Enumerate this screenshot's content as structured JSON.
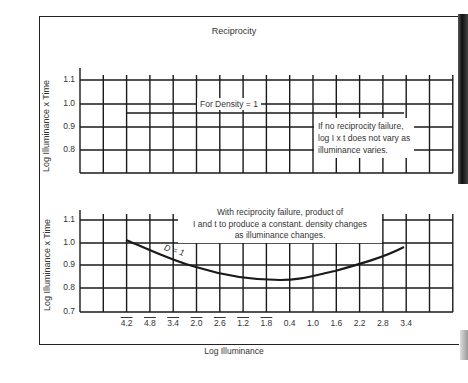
{
  "chart_data": [
    {
      "type": "line",
      "title": "Reciprocity",
      "xlabel": "",
      "ylabel": "Log Illuminance x Time",
      "yticks": [
        "1.1",
        "1.0",
        "0.9",
        "0.8"
      ],
      "ylim": [
        0.7,
        1.1
      ],
      "grid": true,
      "series": [
        {
          "name": "For Density = 1",
          "x_range": [
            1,
            13
          ],
          "y": [
            0.96,
            0.96
          ],
          "note": "horizontal line, constant value"
        }
      ],
      "annotations": [
        "For Density = 1",
        "If no reciprocity failure, log I x t does not vary as illuminance varies."
      ]
    },
    {
      "type": "line",
      "title": "",
      "xlabel": "Log Illuminance",
      "ylabel": "Log Illuminance x Time",
      "yticks": [
        "1.1",
        "1.0",
        "0.9",
        "0.8",
        "0.7"
      ],
      "ylim": [
        0.7,
        1.1
      ],
      "grid": true,
      "categories": [
        "4.2 (bar)",
        "4.8 (bar)",
        "3.4 (bar)",
        "2.0 (bar)",
        "2.6 (bar)",
        "1.2 (bar)",
        "1.8 (bar)",
        "0.4",
        "1.0",
        "1.6",
        "2.2",
        "2.8",
        "3.4"
      ],
      "series": [
        {
          "name": "D = 1",
          "values": [
            1.02,
            0.97,
            0.935,
            0.9,
            0.87,
            0.85,
            0.84,
            0.84,
            0.855,
            0.875,
            0.905,
            0.94,
            0.98
          ]
        }
      ],
      "annotations": [
        "D = 1",
        "With reciprocity failure, product of I and t to produce a constant. density changes as illuminance changes."
      ]
    }
  ],
  "figure": {
    "title": "Reciprocity",
    "top_chart": {
      "ylabel": "Log Illuminance x Time",
      "yticks": [
        "1.1",
        "1.0",
        "0.9",
        "0.8"
      ],
      "line_label": "For Density = 1",
      "note_lines": [
        "If no reciprocity failure,",
        "log I x t does not vary as",
        "illuminance varies."
      ]
    },
    "bottom_chart": {
      "ylabel": "Log Illuminance x Time",
      "yticks": [
        "1.1",
        "1.0",
        "0.9",
        "0.8",
        "0.7"
      ],
      "curve_label": "D = 1",
      "note_lines": [
        "With reciprocity failure, product of",
        "I and t to produce a constant. density changes",
        "as illuminance changes."
      ],
      "xticks": [
        {
          "label": "4.2",
          "bar": true
        },
        {
          "label": "4.8",
          "bar": true
        },
        {
          "label": "3.4",
          "bar": true
        },
        {
          "label": "2.0",
          "bar": true
        },
        {
          "label": "2.6",
          "bar": true
        },
        {
          "label": "1.2",
          "bar": true
        },
        {
          "label": "1.8",
          "bar": true
        },
        {
          "label": "0.4",
          "bar": false
        },
        {
          "label": "1.0",
          "bar": false
        },
        {
          "label": "1.6",
          "bar": false
        },
        {
          "label": "2.2",
          "bar": false
        },
        {
          "label": "2.8",
          "bar": false
        },
        {
          "label": "3.4",
          "bar": false
        }
      ],
      "xlabel": "Log Illuminance"
    }
  }
}
